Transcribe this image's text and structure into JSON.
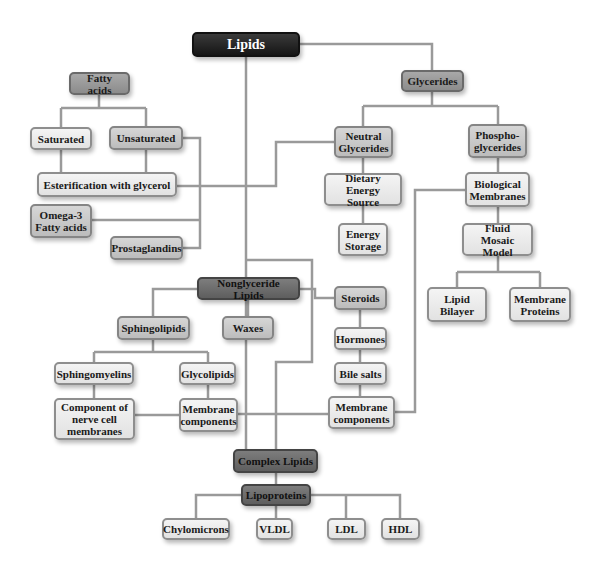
{
  "diagram": {
    "title": "Lipids",
    "nodes": {
      "lipids": "Lipids",
      "fatty_acids": "Fatty acids",
      "glycerides": "Glycerides",
      "saturated": "Saturated",
      "unsaturated": "Unsaturated",
      "neutral_glycerides": "Neutral\nGlycerides",
      "phosphoglycerides": "Phospho-\nglycerides",
      "esterification": "Esterification with glycerol",
      "dietary_energy_source": "Dietary Energy\nSource",
      "biological_membranes": "Biological\nMembranes",
      "omega3": "Omega-3\nFatty acids",
      "energy_storage": "Energy\nStorage",
      "fluid_mosaic_model": "Fluid Mosaic\nModel",
      "prostaglandins": "Prostaglandins",
      "nonglyceride_lipids": "Nonglyceride Lipids",
      "steroids": "Steroids",
      "lipid_bilayer": "Lipid\nBilayer",
      "membrane_proteins": "Membrane\nProteins",
      "sphingolipids": "Sphingolipids",
      "waxes": "Waxes",
      "hormones": "Hormones",
      "sphingomyelins": "Sphingomyelins",
      "glycolipids": "Glycolipids",
      "bile_salts": "Bile salts",
      "nerve_cell_component": "Component of\nnerve cell\nmembranes",
      "membrane_components_left": "Membrane\ncomponents",
      "membrane_components_right": "Membrane\ncomponents",
      "complex_lipids": "Complex Lipids",
      "lipoproteins": "Lipoproteins",
      "chylomicrons": "Chylomicrons",
      "vldl": "VLDL",
      "ldl": "LDL",
      "hdl": "HDL"
    },
    "colors": {
      "line": "#9a9a9a",
      "root_fill": "#1e1e1e",
      "dark_fill": "#6e6e6e",
      "medium_fill": "#c8c8c8",
      "light_fill": "#ececec"
    }
  }
}
